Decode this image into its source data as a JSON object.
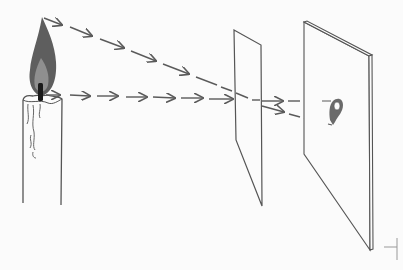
{
  "diagram": {
    "colors": {
      "background": "#fbfbfb",
      "line": "#555555",
      "ray": "#5a5a5a",
      "flame_outer": "#5e5e5e",
      "flame_inner": "#8a8a8a",
      "wick": "#1a1a1a",
      "image_spot": "#6a6a6a"
    },
    "elements": {
      "candle": "candle-with-flame",
      "pane": "transparent-pane",
      "screen": "screen-board",
      "image": "projected-image"
    },
    "rays": [
      {
        "name": "ray-from-flame-tip",
        "from": [
          40,
          17
        ],
        "to": [
          262,
          103
        ]
      },
      {
        "name": "ray-from-flame-base",
        "from": [
          48,
          95
        ],
        "to": [
          262,
          100
        ]
      }
    ]
  }
}
